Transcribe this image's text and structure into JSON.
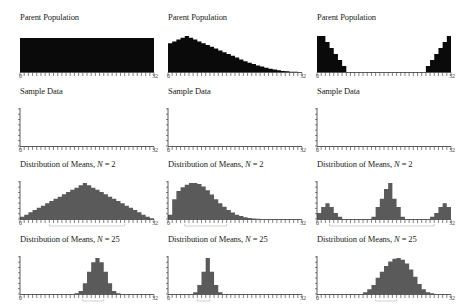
{
  "layout": {
    "columns_x": [
      14,
      162,
      311
    ],
    "rows_y": [
      12,
      86,
      159,
      234
    ]
  },
  "colors": {
    "parent_fill": "#0a0a0a",
    "means_fill": "#5a5a5a",
    "axis": "#333333",
    "spread_line": "#bbbbbb"
  },
  "chart_data": {
    "type": "bar",
    "x_range": [
      0,
      32
    ],
    "x_tick_labels": [
      "0",
      "32"
    ],
    "bins": 32,
    "panels": [
      {
        "row": 0,
        "col": 0,
        "title": "Parent Population",
        "kind": "parent",
        "values": [
          1,
          1,
          1,
          1,
          1,
          1,
          1,
          1,
          1,
          1,
          1,
          1,
          1,
          1,
          1,
          1,
          1,
          1,
          1,
          1,
          1,
          1,
          1,
          1,
          1,
          1,
          1,
          1,
          1,
          1,
          1,
          1
        ]
      },
      {
        "row": 0,
        "col": 1,
        "title": "Parent Population",
        "kind": "parent",
        "values": [
          0.8,
          0.85,
          0.9,
          0.95,
          1.0,
          0.95,
          0.9,
          0.85,
          0.8,
          0.75,
          0.7,
          0.65,
          0.6,
          0.55,
          0.5,
          0.45,
          0.4,
          0.35,
          0.3,
          0.26,
          0.22,
          0.18,
          0.15,
          0.12,
          0.09,
          0.07,
          0.05,
          0.03,
          0.02,
          0.01,
          0.005,
          0
        ]
      },
      {
        "row": 0,
        "col": 2,
        "title": "Parent Population",
        "kind": "parent",
        "values": [
          1,
          1,
          0.83,
          0.67,
          0.5,
          0.33,
          0.17,
          0,
          0,
          0,
          0,
          0,
          0,
          0,
          0,
          0,
          0,
          0,
          0,
          0,
          0,
          0,
          0,
          0,
          0,
          0,
          0.17,
          0.33,
          0.5,
          0.67,
          0.83,
          1,
          1
        ]
      },
      {
        "row": 1,
        "col": 0,
        "title": "Sample Data",
        "kind": "empty",
        "values": []
      },
      {
        "row": 1,
        "col": 1,
        "title": "Sample Data",
        "kind": "empty",
        "values": []
      },
      {
        "row": 1,
        "col": 2,
        "title": "Sample Data",
        "kind": "empty",
        "values": []
      },
      {
        "row": 2,
        "col": 0,
        "title_prefix": "Distribution of Means, ",
        "title_var": "N",
        "title_suffix": " = 2",
        "kind": "means",
        "values": [
          0.06,
          0.12,
          0.19,
          0.25,
          0.31,
          0.37,
          0.44,
          0.5,
          0.56,
          0.62,
          0.69,
          0.75,
          0.81,
          0.87,
          0.94,
          1.0,
          0.94,
          0.87,
          0.81,
          0.75,
          0.69,
          0.62,
          0.56,
          0.5,
          0.44,
          0.37,
          0.31,
          0.25,
          0.19,
          0.12,
          0.06,
          0.02
        ],
        "spread": [
          7,
          24
        ]
      },
      {
        "row": 2,
        "col": 1,
        "title_prefix": "Distribution of Means, ",
        "title_var": "N",
        "title_suffix": " = 2",
        "kind": "means",
        "values": [
          0.12,
          0.55,
          0.78,
          0.88,
          0.95,
          1.0,
          1.0,
          0.97,
          0.9,
          0.8,
          0.68,
          0.55,
          0.44,
          0.34,
          0.25,
          0.18,
          0.12,
          0.08,
          0.05,
          0.03,
          0.015,
          0.005,
          0,
          0,
          0,
          0,
          0,
          0,
          0,
          0,
          0,
          0
        ],
        "spread": [
          4,
          13
        ]
      },
      {
        "row": 2,
        "col": 2,
        "title_prefix": "Distribution of Means, ",
        "title_var": "N",
        "title_suffix": " = 2",
        "kind": "means",
        "values": [
          0.17,
          0.33,
          0.44,
          0.33,
          0.17,
          0.06,
          0,
          0,
          0,
          0,
          0,
          0,
          0,
          0.06,
          0.33,
          0.56,
          0.83,
          1.0,
          0.56,
          0.33,
          0.06,
          0,
          0,
          0,
          0,
          0,
          0,
          0.06,
          0.17,
          0.33,
          0.44,
          0.33
        ],
        "spread": [
          3,
          27
        ]
      },
      {
        "row": 3,
        "col": 0,
        "title_prefix": "Distribution of Means, ",
        "title_var": "N",
        "title_suffix": " = 25",
        "kind": "means",
        "values": [
          0,
          0,
          0,
          0,
          0,
          0,
          0,
          0,
          0,
          0,
          0,
          0,
          0,
          0.02,
          0.08,
          0.3,
          0.62,
          0.88,
          1.0,
          0.88,
          0.62,
          0.3,
          0.08,
          0.02,
          0,
          0,
          0,
          0,
          0,
          0,
          0,
          0
        ],
        "spread": [
          15,
          19
        ]
      },
      {
        "row": 3,
        "col": 1,
        "title_prefix": "Distribution of Means, ",
        "title_var": "N",
        "title_suffix": " = 25",
        "kind": "means",
        "values": [
          0,
          0,
          0,
          0,
          0,
          0,
          0.05,
          0.25,
          0.62,
          1.0,
          0.62,
          0.25,
          0.05,
          0,
          0,
          0,
          0,
          0,
          0,
          0,
          0,
          0,
          0,
          0,
          0,
          0,
          0,
          0,
          0,
          0,
          0,
          0
        ],
        "spread": [
          7,
          9
        ]
      },
      {
        "row": 3,
        "col": 2,
        "title_prefix": "Distribution of Means, ",
        "title_var": "N",
        "title_suffix": " = 25",
        "kind": "means",
        "values": [
          0,
          0,
          0,
          0,
          0,
          0,
          0,
          0,
          0,
          0,
          0,
          0.05,
          0.13,
          0.25,
          0.45,
          0.62,
          0.78,
          0.9,
          0.98,
          1.0,
          0.95,
          0.85,
          0.68,
          0.48,
          0.28,
          0.13,
          0.05,
          0.02,
          0,
          0,
          0,
          0
        ],
        "spread": [
          14,
          18
        ]
      }
    ]
  }
}
